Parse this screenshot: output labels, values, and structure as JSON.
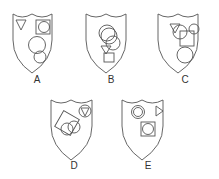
{
  "figure": {
    "type": "multiple-choice shield options",
    "options": [
      {
        "label": "A",
        "shapes": [
          "triangle",
          "square",
          "circle",
          "circle",
          "circle"
        ]
      },
      {
        "label": "B",
        "shapes": [
          "circle",
          "circle",
          "circle",
          "triangle",
          "square"
        ]
      },
      {
        "label": "C",
        "shapes": [
          "triangle",
          "circle",
          "circle",
          "square",
          "circle"
        ]
      },
      {
        "label": "D",
        "shapes": [
          "square",
          "circle",
          "circle",
          "circle",
          "triangle"
        ]
      },
      {
        "label": "E",
        "shapes": [
          "circle",
          "circle",
          "triangle",
          "square",
          "circle"
        ]
      }
    ]
  },
  "colors": {
    "stroke": "#555555",
    "background": "#ffffff",
    "text": "#333333"
  }
}
